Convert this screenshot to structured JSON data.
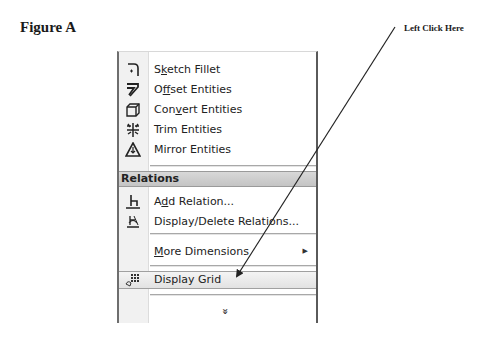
{
  "figure": {
    "title": "Figure A",
    "callout_text": "Left Click Here"
  },
  "menu": {
    "items_top": [
      {
        "label_pre": "S",
        "label_u": "k",
        "label_post": "etch Fillet",
        "icon": "sketch-fillet-icon"
      },
      {
        "label_pre": "O",
        "label_u": "f",
        "label_post": "fset Entities",
        "icon": "offset-entities-icon"
      },
      {
        "label_pre": "Con",
        "label_u": "v",
        "label_post": "ert Entities",
        "icon": "convert-entities-icon"
      },
      {
        "label_pre": "Trim Entities",
        "label_u": "",
        "label_post": "",
        "icon": "trim-entities-icon"
      },
      {
        "label_pre": "Mirror Entities",
        "label_u": "",
        "label_post": "",
        "icon": "mirror-entities-icon"
      }
    ],
    "section_header": "Relations",
    "items_relations": [
      {
        "label_pre": "A",
        "label_u": "d",
        "label_post": "d Relation...",
        "icon": "add-relation-icon"
      },
      {
        "label_pre": "Display/Delete Relations...",
        "label_u": "",
        "label_post": "",
        "icon": "display-delete-relations-icon"
      }
    ],
    "more_dimensions": {
      "label_u": "M",
      "label_post": "ore Dimensions",
      "submenu_glyph": "▶"
    },
    "display_grid": {
      "label": "Display Grid",
      "icon": "display-grid-icon",
      "highlighted": true
    },
    "expand_glyph": "»"
  },
  "annotation": {
    "arrow_from": [
      395,
      27
    ],
    "arrow_to": [
      236,
      277
    ],
    "color": "#222222"
  }
}
